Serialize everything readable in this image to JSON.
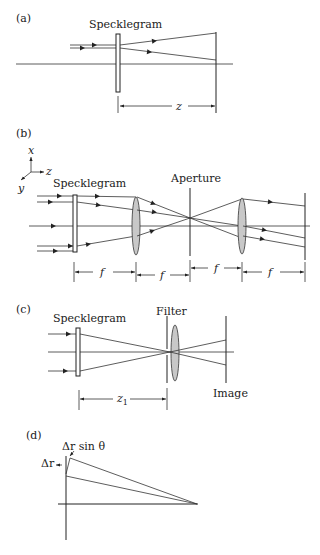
{
  "figure": {
    "panels": [
      {
        "id": "a",
        "label": "(a)",
        "component_labels": [
          "Specklegram"
        ],
        "dimensions": [
          "z"
        ]
      },
      {
        "id": "b",
        "label": "(b)",
        "component_labels": [
          "Specklegram",
          "Aperture"
        ],
        "axes": [
          "x",
          "y",
          "z"
        ],
        "dimensions": [
          "f",
          "f",
          "f",
          "f"
        ]
      },
      {
        "id": "c",
        "label": "(c)",
        "component_labels": [
          "Specklegram",
          "Filter",
          "Image"
        ],
        "dimensions": [
          "z1"
        ]
      },
      {
        "id": "d",
        "label": "(d)",
        "annotations": [
          "Δr sin θ",
          "Δr"
        ]
      }
    ]
  },
  "panel_a": {
    "label": "(a)",
    "specklegram": "Specklegram",
    "dim_z": "z"
  },
  "panel_b": {
    "label": "(b)",
    "axis_x": "x",
    "axis_y": "y",
    "axis_z": "z",
    "specklegram": "Specklegram",
    "aperture": "Aperture",
    "dim_f": "f"
  },
  "panel_c": {
    "label": "(c)",
    "specklegram": "Specklegram",
    "filter": "Filter",
    "image": "Image",
    "dim_z1_main": "z",
    "dim_z1_sub": "1"
  },
  "panel_d": {
    "label": "(d)",
    "dr_sin_theta": "Δr sin θ",
    "dr": "Δr"
  },
  "colors": {
    "line": "#222222",
    "lens_fill": "#c8c8c8",
    "background": "#ffffff"
  }
}
